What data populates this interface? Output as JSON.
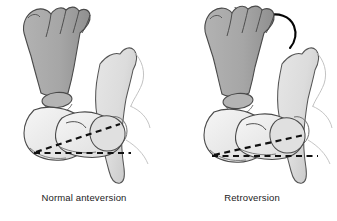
{
  "figure": {
    "background_color": "#ffffff",
    "panels": [
      {
        "id": "normal-anteversion",
        "caption": "Normal anteversion",
        "has_rotation_arrow": false,
        "femoral_neck_axis_label": "",
        "condylar_axis_label": "",
        "version_description": "Femoral neck axis angles anteriorly relative to the transcondylar axis",
        "neck_axis_angle_deg": 18,
        "condylar_axis_angle_deg": 0
      },
      {
        "id": "retroversion",
        "caption": "Retroversion",
        "has_rotation_arrow": true,
        "rotation_arrow_direction": "counterclockwise",
        "femoral_neck_axis_label": "",
        "condylar_axis_label": "",
        "version_description": "Femoral neck axis angles posteriorly; foot rotates outward",
        "neck_axis_angle_deg": 11,
        "condylar_axis_angle_deg": 0
      }
    ]
  },
  "colors": {
    "foot_fill": "#a6a6a6",
    "foot_shade": "#969696",
    "bone_fill": "#e9e9e9",
    "bone_fill_light": "#f4f4f4",
    "pelvis_fill": "#dedede",
    "outline": "#3a3a3a",
    "outline_soft": "#8a8a8a",
    "dashed_line": "#111111",
    "arrow": "#050505",
    "caption_text": "#1b1b1b",
    "background": "#ffffff"
  },
  "icons": {
    "rotation_arrow": "curved-arrow-icon"
  }
}
